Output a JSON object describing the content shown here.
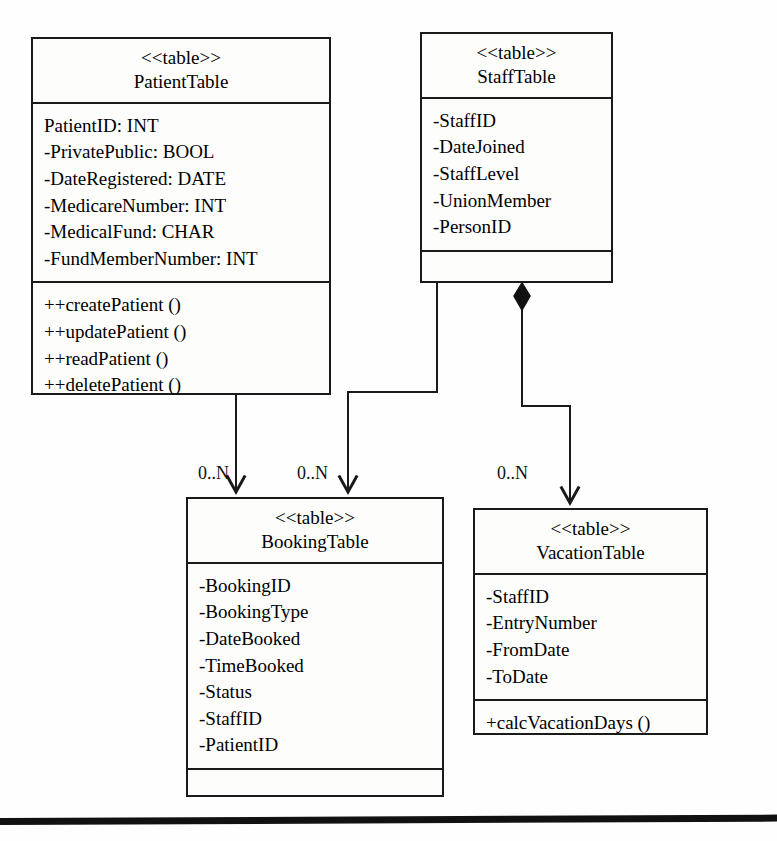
{
  "diagram": {
    "type": "uml-class-diagram",
    "classes": [
      {
        "id": "patient-table",
        "stereotype": "<<table>>",
        "name": "PatientTable",
        "attributes": [
          "PatientID: INT",
          "-PrivatePublic: BOOL",
          "-DateRegistered: DATE",
          "-MedicareNumber: INT",
          "-MedicalFund: CHAR",
          "-FundMemberNumber: INT"
        ],
        "methods": [
          "++createPatient ()",
          "++updatePatient ()",
          "++readPatient ()",
          "++deletePatient ()"
        ]
      },
      {
        "id": "staff-table",
        "stereotype": "<<table>>",
        "name": "StaffTable",
        "attributes": [
          "-StaffID",
          "-DateJoined",
          "-StaffLevel",
          "-UnionMember",
          "-PersonID"
        ],
        "methods": []
      },
      {
        "id": "booking-table",
        "stereotype": "<<table>>",
        "name": "BookingTable",
        "attributes": [
          "-BookingID",
          "-BookingType",
          "-DateBooked",
          "-TimeBooked",
          "-Status",
          "-StaffID",
          "-PatientID"
        ],
        "methods": []
      },
      {
        "id": "vacation-table",
        "stereotype": "<<table>>",
        "name": "VacationTable",
        "attributes": [
          "-StaffID",
          "-EntryNumber",
          "-FromDate",
          "-ToDate"
        ],
        "methods": [
          "+calcVacationDays ()"
        ]
      }
    ],
    "relationships": [
      {
        "id": "patient-booking",
        "from": "PatientTable",
        "to": "BookingTable",
        "kind": "directed-association",
        "multiplicity": "0..N"
      },
      {
        "id": "staff-booking",
        "from": "StaffTable",
        "to": "BookingTable",
        "kind": "directed-association",
        "multiplicity": "0..N"
      },
      {
        "id": "staff-vacation",
        "from": "StaffTable",
        "to": "VacationTable",
        "kind": "composition",
        "multiplicity": "0..N"
      }
    ],
    "colors": {
      "line": "#1a1a1a",
      "fill": "#fdfdfc",
      "text": "#111111"
    }
  }
}
